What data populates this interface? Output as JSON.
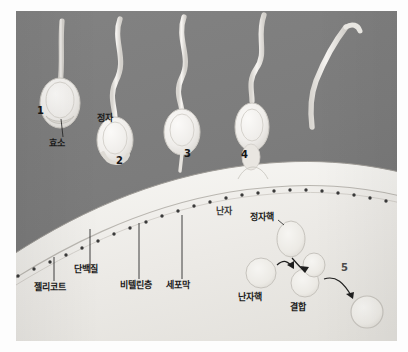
{
  "figure": {
    "title_present": false,
    "background_color": "#7e7e7e",
    "egg_color": "#eceae6",
    "sperm_color": "#f2f0ec",
    "ink_color": "#1b1b1b"
  },
  "labels": {
    "enzyme": "효소",
    "sperm": "정자",
    "egg": "난자",
    "jelly_coat": "젤리코트",
    "protein": "단백질",
    "vitelline_layer": "비텔린층",
    "cell_membrane": "세포막",
    "sperm_nucleus": "정자핵",
    "egg_nucleus": "난자핵",
    "fusion": "결합"
  },
  "step_numbers": {
    "one": "1",
    "two": "2",
    "three": "3",
    "four": "4",
    "five": "5"
  },
  "sperm_stages": [
    {
      "number": "1",
      "label": "효소",
      "description": "acrosome-reaction-enzyme-release"
    },
    {
      "number": "2",
      "label": "정자",
      "description": "sperm-approaching-jelly-coat"
    },
    {
      "number": "3",
      "label": "",
      "description": "sperm-binding-vitelline-layer"
    },
    {
      "number": "4",
      "label": "",
      "description": "sperm-penetrating-cell-membrane"
    },
    {
      "number": "5",
      "label": "결합",
      "description": "nuclear-fusion-zygote"
    }
  ],
  "egg_layers": [
    {
      "name": "젤리코트"
    },
    {
      "name": "단백질"
    },
    {
      "name": "비텔린층"
    },
    {
      "name": "세포막"
    }
  ],
  "nuclei": [
    {
      "name": "정자핵"
    },
    {
      "name": "난자핵"
    },
    {
      "name": "결합"
    }
  ]
}
